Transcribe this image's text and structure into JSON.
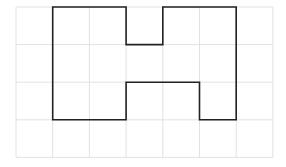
{
  "canvas": {
    "width": 286,
    "height": 167,
    "background": "#ffffff"
  },
  "grid": {
    "columns": 7,
    "rows": 4,
    "left": 16,
    "top": 7,
    "cell_width": 36.7,
    "cell_height": 37.6,
    "line_color": "#e2e2e2"
  },
  "shape": {
    "description": "H-shaped rectilinear polygon drawn on square grid",
    "stroke_color": "#222222",
    "stroke_width": 1.6,
    "vertices_grid_units": [
      [
        1,
        0
      ],
      [
        3,
        0
      ],
      [
        3,
        1
      ],
      [
        4,
        1
      ],
      [
        4,
        0
      ],
      [
        6,
        0
      ],
      [
        6,
        3
      ],
      [
        5,
        3
      ],
      [
        5,
        2
      ],
      [
        3,
        2
      ],
      [
        3,
        3
      ],
      [
        1,
        3
      ]
    ]
  }
}
